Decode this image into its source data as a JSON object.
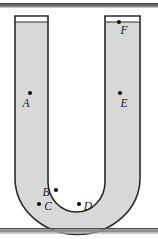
{
  "figure": {
    "type": "physics-diagram",
    "width": 158,
    "height": 239,
    "background_color": "#ffffff"
  },
  "colors": {
    "fluid": "#d8d8d8",
    "outline": "#2b2b2b",
    "bar": "#8a8a8a",
    "bar_dark": "#555555",
    "dot": "#101010",
    "empty": "#ffffff"
  },
  "bars": {
    "top": {
      "name": "ceiling-bar",
      "x": 0,
      "y": 3,
      "width": 158,
      "height": 4
    },
    "bottom": {
      "name": "ground-bar",
      "x": 0,
      "y": 228,
      "width": 158,
      "height": 5
    }
  },
  "tube": {
    "left_arm": {
      "outer_x": 15,
      "inner_x": 48,
      "top_y": 16
    },
    "right_arm": {
      "inner_x": 105,
      "outer_x": 140,
      "top_y": 16
    },
    "fluid_surface_y": 22,
    "bend_bottom_y": 228
  },
  "points": [
    {
      "id": "A",
      "label": "A",
      "label_x": 30,
      "label_y": 106,
      "dot_x": 30,
      "dot_y": 93
    },
    {
      "id": "B",
      "label": "B",
      "label_x": 42,
      "label_y": 195,
      "dot_x": 56,
      "dot_y": 190
    },
    {
      "id": "C",
      "label": "C",
      "label_x": 46,
      "label_y": 209,
      "dot_x": 39,
      "dot_y": 204
    },
    {
      "id": "D",
      "label": "D",
      "label_x": 86,
      "label_y": 209,
      "dot_x": 79,
      "dot_y": 204
    },
    {
      "id": "E",
      "label": "E",
      "label_x": 120,
      "label_y": 106,
      "dot_x": 120,
      "dot_y": 93
    },
    {
      "id": "F",
      "label": "F",
      "label_x": 120,
      "label_y": 33,
      "dot_x": 120,
      "dot_y": 22
    }
  ],
  "point_labels": {
    "A": "A",
    "B": "B",
    "C": "C",
    "D": "D",
    "E": "E",
    "F": "F"
  }
}
